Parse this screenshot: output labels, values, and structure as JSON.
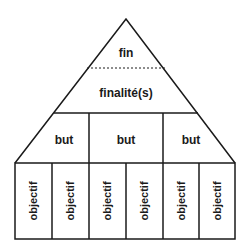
{
  "diagram": {
    "type": "pyramid-hierarchy",
    "apex": {
      "top_label": "fin",
      "bottom_label": "finalité(s)"
    },
    "middle_tier": {
      "items": [
        {
          "label": "but"
        },
        {
          "label": "but"
        },
        {
          "label": "but"
        }
      ]
    },
    "base_tier": {
      "items": [
        {
          "label": "objectif"
        },
        {
          "label": "objectif"
        },
        {
          "label": "objectif"
        },
        {
          "label": "objectif"
        },
        {
          "label": "objectif"
        },
        {
          "label": "objectif"
        }
      ]
    },
    "colors": {
      "stroke": "#1a1a1a",
      "background": "#ffffff"
    }
  }
}
